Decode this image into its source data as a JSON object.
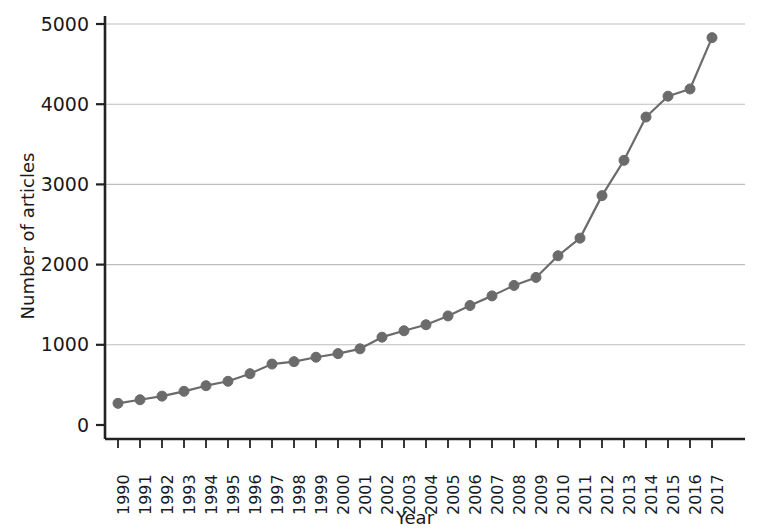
{
  "chart_data": {
    "type": "line",
    "title": "",
    "subtitle": "",
    "xlabel": "Year",
    "ylabel": "Number of articles",
    "categories": [
      1990,
      1991,
      1992,
      1993,
      1994,
      1995,
      1996,
      1997,
      1998,
      1999,
      2000,
      2001,
      2002,
      2003,
      2004,
      2005,
      2006,
      2007,
      2008,
      2009,
      2010,
      2011,
      2012,
      2013,
      2014,
      2015,
      2016,
      2017
    ],
    "x": [
      1990,
      1991,
      1992,
      1993,
      1994,
      1995,
      1996,
      1997,
      1998,
      1999,
      2000,
      2001,
      2002,
      2003,
      2004,
      2005,
      2006,
      2007,
      2008,
      2009,
      2010,
      2011,
      2012,
      2013,
      2014,
      2015,
      2016,
      2017
    ],
    "values": [
      270,
      315,
      360,
      420,
      490,
      545,
      640,
      760,
      790,
      845,
      890,
      950,
      1095,
      1175,
      1250,
      1360,
      1490,
      1610,
      1740,
      1840,
      2110,
      2330,
      2860,
      3300,
      3840,
      4100,
      4190,
      4830
    ],
    "series": [
      {
        "name": "Number of articles",
        "values": [
          270,
          315,
          360,
          420,
          490,
          545,
          640,
          760,
          790,
          845,
          890,
          950,
          1095,
          1175,
          1250,
          1360,
          1490,
          1610,
          1740,
          1840,
          2110,
          2330,
          2860,
          3300,
          3840,
          4100,
          4190,
          4830
        ]
      }
    ],
    "xtick_labels": [
      "1990",
      "1991",
      "1992",
      "1993",
      "1994",
      "1995",
      "1996",
      "1997",
      "1998",
      "1999",
      "2000",
      "2001",
      "2002",
      "2003",
      "2004",
      "2005",
      "2006",
      "2007",
      "2008",
      "2009",
      "2010",
      "2011",
      "2012",
      "2013",
      "2014",
      "2015",
      "2016",
      "2017"
    ],
    "ytick_labels": [
      "0",
      "1000",
      "2000",
      "3000",
      "4000",
      "5000"
    ],
    "yticks": [
      0,
      1000,
      2000,
      3000,
      4000,
      5000
    ],
    "ylim": [
      0,
      5100
    ],
    "xlim": [
      1989.4,
      2017.8
    ],
    "grid": {
      "horizontal": true,
      "vertical": false
    },
    "legend": {
      "visible": false,
      "position": "none"
    },
    "marker": {
      "shape": "circle",
      "size": 9
    },
    "colors": {
      "line": "#6b6b6b",
      "marker": "#6b6b6b",
      "grid": "#bdbdbd",
      "axis": "#222222",
      "text": "#1a1a1a",
      "background": "#ffffff"
    },
    "xtick_label_rotation": -90
  }
}
